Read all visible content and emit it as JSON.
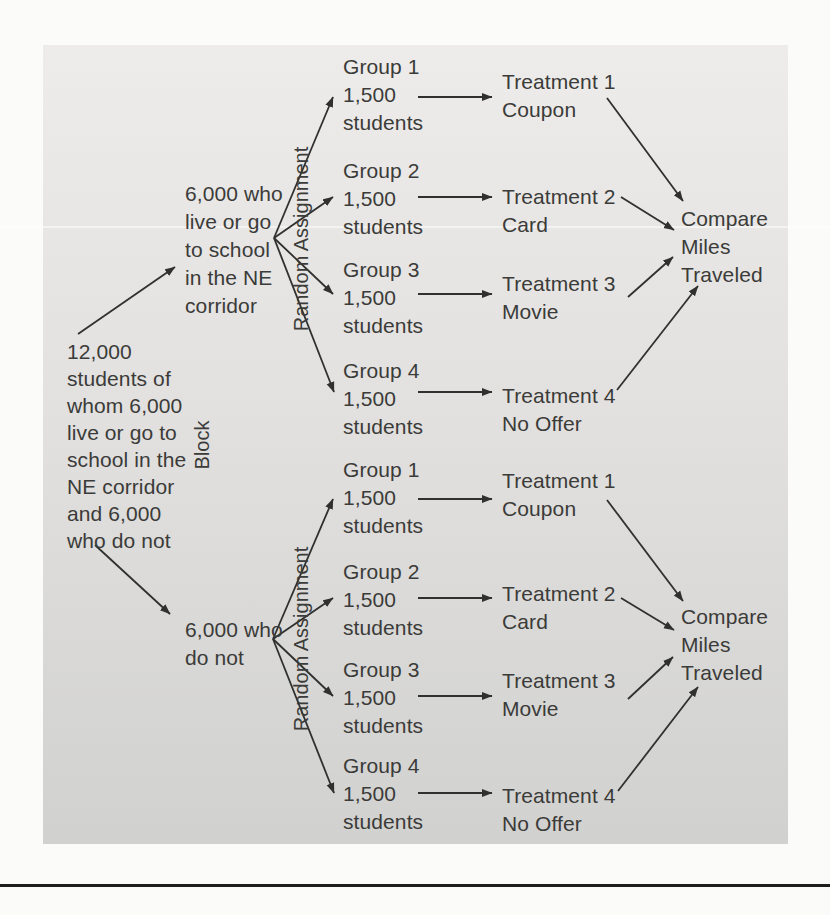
{
  "colors": {
    "text": "#3b3b39",
    "arrow": "#30302e",
    "panel_top": "#edecea",
    "panel_mid": "#e2e1df",
    "panel_bottom": "#d1d1cf",
    "page_bg": "#fbfbf9",
    "rule": "#1e1e1c"
  },
  "diagram": {
    "population_label": "12,000\nstudents of\nwhom 6,000\nlive or go to\nschool in the\nNE corridor\nand 6,000\nwho do not",
    "block_axis_label": "Block",
    "blocks": [
      {
        "label": "6,000 who\nlive or go\nto school\nin the NE\ncorridor",
        "assignment_label": "Random Assignment",
        "groups": [
          "Group 1\n1,500\nstudents",
          "Group 2\n1,500\nstudents",
          "Group 3\n1,500\nstudents",
          "Group 4\n1,500\nstudents"
        ],
        "treatments": [
          "Treatment 1\nCoupon",
          "Treatment 2\nCard",
          "Treatment 3\nMovie",
          "Treatment 4\nNo Offer"
        ],
        "outcome_label": "Compare\nMiles\nTraveled"
      },
      {
        "label": "6,000 who\ndo not",
        "assignment_label": "Random Assignment",
        "groups": [
          "Group 1\n1,500\nstudents",
          "Group 2\n1,500\nstudents",
          "Group 3\n1,500\nstudents",
          "Group 4\n1,500\nstudents"
        ],
        "treatments": [
          "Treatment 1\nCoupon",
          "Treatment 2\nCard",
          "Treatment 3\nMovie",
          "Treatment 4\nNo Offer"
        ],
        "outcome_label": "Compare\nMiles\nTraveled"
      }
    ]
  }
}
